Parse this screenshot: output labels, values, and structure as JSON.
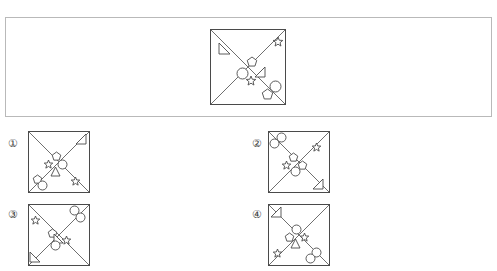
{
  "page": {
    "width": 497,
    "height": 271,
    "background": "#ffffff",
    "stroke_color": "#4a4a4a",
    "frame_color": "#b9b9b9",
    "label_color": "#3c3c3c"
  },
  "question_frame": {
    "x": 5,
    "y": 17,
    "width": 487,
    "height": 100,
    "name": "question-panel"
  },
  "prompt_figure": {
    "name": "prompt-figure",
    "x": 210,
    "y": 29,
    "size": 76,
    "diagonals": [
      "tl-br",
      "tr-bl"
    ],
    "shapes": [
      {
        "kind": "triangle-right",
        "x": 9,
        "y": 14,
        "size": 11,
        "rotation": 0,
        "note": "small right triangle near top-left corner"
      },
      {
        "kind": "star",
        "x": 63,
        "y": 8,
        "size": 10,
        "rotation": 0,
        "note": "five point star near top-right corner"
      },
      {
        "kind": "pentagon",
        "x": 37,
        "y": 28,
        "size": 10,
        "rotation": 0,
        "note": "center cluster, top"
      },
      {
        "kind": "circle",
        "x": 27,
        "y": 39,
        "size": 11,
        "rotation": 0,
        "note": "center cluster, left"
      },
      {
        "kind": "triangle-left",
        "x": 45,
        "y": 38,
        "size": 10,
        "rotation": 0,
        "note": "center cluster, right"
      },
      {
        "kind": "star",
        "x": 36,
        "y": 47,
        "size": 10,
        "rotation": 0,
        "note": "center cluster, bottom"
      },
      {
        "kind": "circle",
        "x": 60,
        "y": 52,
        "size": 11,
        "rotation": 0,
        "note": "lower right, upper circle"
      },
      {
        "kind": "pentagon",
        "x": 52,
        "y": 60,
        "size": 11,
        "rotation": 0,
        "note": "lower right, pentagon"
      }
    ]
  },
  "options": [
    {
      "label": "①",
      "name": "option-1",
      "label_x": 8,
      "label_y": 138,
      "figure": {
        "x": 28,
        "y": 131,
        "size": 62
      },
      "diagonals": [
        "tl-br",
        "tr-bl"
      ],
      "shapes": [
        {
          "kind": "triangle-left",
          "x": 48,
          "y": 3,
          "size": 10
        },
        {
          "kind": "pentagon",
          "x": 24,
          "y": 21,
          "size": 9
        },
        {
          "kind": "star",
          "x": 16,
          "y": 29,
          "size": 9
        },
        {
          "kind": "circle",
          "x": 30,
          "y": 29,
          "size": 9
        },
        {
          "kind": "triangle-up",
          "x": 23,
          "y": 36,
          "size": 9
        },
        {
          "kind": "pentagon",
          "x": 5,
          "y": 44,
          "size": 9
        },
        {
          "kind": "circle",
          "x": 10,
          "y": 50,
          "size": 9
        },
        {
          "kind": "star",
          "x": 43,
          "y": 46,
          "size": 9
        }
      ]
    },
    {
      "label": "②",
      "name": "option-2",
      "label_x": 252,
      "label_y": 138,
      "figure": {
        "x": 268,
        "y": 131,
        "size": 62
      },
      "diagonals": [
        "tl-br",
        "tr-bl"
      ],
      "shapes": [
        {
          "kind": "circle",
          "x": 9,
          "y": 2,
          "size": 9
        },
        {
          "kind": "circle",
          "x": 2,
          "y": 8,
          "size": 9
        },
        {
          "kind": "star",
          "x": 44,
          "y": 12,
          "size": 9
        },
        {
          "kind": "pentagon",
          "x": 21,
          "y": 22,
          "size": 9
        },
        {
          "kind": "star",
          "x": 14,
          "y": 30,
          "size": 9
        },
        {
          "kind": "pentagon",
          "x": 30,
          "y": 30,
          "size": 9
        },
        {
          "kind": "circle",
          "x": 23,
          "y": 36,
          "size": 9
        },
        {
          "kind": "triangle-left",
          "x": 45,
          "y": 48,
          "size": 10
        }
      ]
    },
    {
      "label": "③",
      "name": "option-3",
      "label_x": 8,
      "label_y": 209,
      "figure": {
        "x": 28,
        "y": 204,
        "size": 62
      },
      "diagonals": [
        "tl-br",
        "tr-bl"
      ],
      "shapes": [
        {
          "kind": "circle",
          "x": 42,
          "y": 2,
          "size": 9
        },
        {
          "kind": "circle",
          "x": 48,
          "y": 9,
          "size": 9
        },
        {
          "kind": "star",
          "x": 3,
          "y": 12,
          "size": 9
        },
        {
          "kind": "pentagon",
          "x": 20,
          "y": 25,
          "size": 9
        },
        {
          "kind": "triangle-right",
          "x": 26,
          "y": 30,
          "size": 9
        },
        {
          "kind": "star",
          "x": 34,
          "y": 32,
          "size": 9
        },
        {
          "kind": "circle",
          "x": 23,
          "y": 37,
          "size": 9
        },
        {
          "kind": "triangle-right",
          "x": 2,
          "y": 48,
          "size": 10
        }
      ]
    },
    {
      "label": "④",
      "name": "option-4",
      "label_x": 252,
      "label_y": 209,
      "figure": {
        "x": 268,
        "y": 204,
        "size": 62
      },
      "diagonals": [
        "tl-br",
        "tr-bl"
      ],
      "shapes": [
        {
          "kind": "triangle-left",
          "x": 3,
          "y": 3,
          "size": 10
        },
        {
          "kind": "circle",
          "x": 24,
          "y": 21,
          "size": 9
        },
        {
          "kind": "pentagon",
          "x": 17,
          "y": 29,
          "size": 9
        },
        {
          "kind": "star",
          "x": 32,
          "y": 29,
          "size": 9
        },
        {
          "kind": "triangle-up",
          "x": 23,
          "y": 35,
          "size": 9
        },
        {
          "kind": "star",
          "x": 5,
          "y": 45,
          "size": 9
        },
        {
          "kind": "circle",
          "x": 44,
          "y": 44,
          "size": 9
        },
        {
          "kind": "circle",
          "x": 38,
          "y": 50,
          "size": 9
        }
      ]
    }
  ]
}
